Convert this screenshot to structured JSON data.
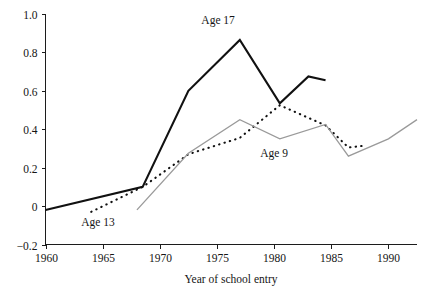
{
  "chart_data": {
    "type": "line",
    "title": "",
    "xlabel": "Year of school entry",
    "ylabel": "",
    "xlim": [
      1960,
      1992.5
    ],
    "ylim": [
      -0.2,
      1.0
    ],
    "grid": false,
    "legend_position": "inline-annotations",
    "x_ticks": [
      1960,
      1965,
      1970,
      1975,
      1980,
      1985,
      1990
    ],
    "x_tick_labels": [
      "1960",
      "1965",
      "1970",
      "1975",
      "1980",
      "1985",
      "1990"
    ],
    "y_ticks": [
      -0.2,
      0,
      0.2,
      0.4,
      0.6,
      0.8,
      1.0
    ],
    "y_tick_labels": [
      "−0.2",
      "0",
      "0.2",
      "0.4",
      "0.6",
      "0.8",
      "1.0"
    ],
    "series": [
      {
        "name": "Age 17",
        "style": "solid",
        "color": "#111111",
        "annotation": "Age 17",
        "annotation_at": {
          "x": 1975.1,
          "y": 0.95
        },
        "x": [
          1960.0,
          1968.5,
          1972.5,
          1977.0,
          1980.5,
          1983.0,
          1984.5
        ],
        "values": [
          -0.02,
          0.1,
          0.6,
          0.865,
          0.535,
          0.675,
          0.655
        ]
      },
      {
        "name": "Age 13",
        "style": "dotted",
        "color": "#111111",
        "annotation": "Age 13",
        "annotation_at": {
          "x": 1964.6,
          "y": -0.105
        },
        "x": [
          1964.0,
          1968.5,
          1972.5,
          1977.0,
          1980.5,
          1984.5,
          1986.5,
          1988.0
        ],
        "values": [
          -0.03,
          0.1,
          0.27,
          0.355,
          0.525,
          0.42,
          0.305,
          0.315
        ]
      },
      {
        "name": "Age 9",
        "style": "solid",
        "color": "#9a9a9a",
        "annotation": "Age 9",
        "annotation_at": {
          "x": 1980.0,
          "y": 0.255
        },
        "x": [
          1968.0,
          1972.5,
          1977.0,
          1980.5,
          1984.5,
          1986.5,
          1990.0,
          1992.5
        ],
        "values": [
          -0.02,
          0.275,
          0.45,
          0.35,
          0.425,
          0.26,
          0.35,
          0.45
        ]
      }
    ]
  },
  "figure": {
    "x_axis_title": "Year of school entry"
  }
}
